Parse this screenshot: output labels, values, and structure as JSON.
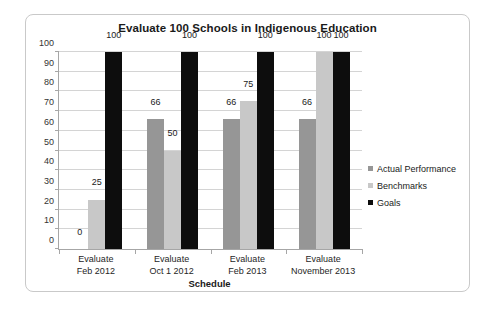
{
  "chart_data": {
    "type": "bar",
    "title": "Evaluate 100 Schools in Indigenous Education",
    "xlabel": "Schedule",
    "ylabel": "",
    "ylim": [
      0,
      100
    ],
    "ytick_step": 10,
    "yticks": [
      100,
      90,
      80,
      70,
      60,
      50,
      40,
      30,
      20,
      10,
      0
    ],
    "grid": true,
    "legend_position": "right",
    "categories": [
      "Evaluate\nFeb 2012",
      "Evaluate\nOct 1 2012",
      "Evaluate\nFeb 2013",
      "Evaluate\nNovember 2013"
    ],
    "categories_lines": [
      [
        "Evaluate",
        "Feb 2012"
      ],
      [
        "Evaluate",
        "Oct 1 2012"
      ],
      [
        "Evaluate",
        "Feb 2013"
      ],
      [
        "Evaluate",
        "November 2013"
      ]
    ],
    "series": [
      {
        "name": "Actual Performance",
        "color": "#969696",
        "values": [
          0,
          66,
          66,
          66
        ],
        "labels": [
          "0",
          "66",
          "66",
          "66"
        ]
      },
      {
        "name": "Benchmarks",
        "color": "#c8c8c8",
        "values": [
          25,
          50,
          75,
          100
        ],
        "labels": [
          "25",
          "50",
          "75",
          "100"
        ]
      },
      {
        "name": "Goals",
        "color": "#0d0d0d",
        "values": [
          100,
          100,
          100,
          100
        ],
        "labels": [
          "100",
          "100",
          "100",
          "100"
        ]
      }
    ]
  },
  "legend": {
    "items": [
      {
        "label": "Actual Performance",
        "color": "#969696"
      },
      {
        "label": "Benchmarks",
        "color": "#c8c8c8"
      },
      {
        "label": "Goals",
        "color": "#0d0d0d"
      }
    ]
  },
  "frame": {
    "border_color": "#c9c9c9",
    "background": "#ffffff"
  }
}
